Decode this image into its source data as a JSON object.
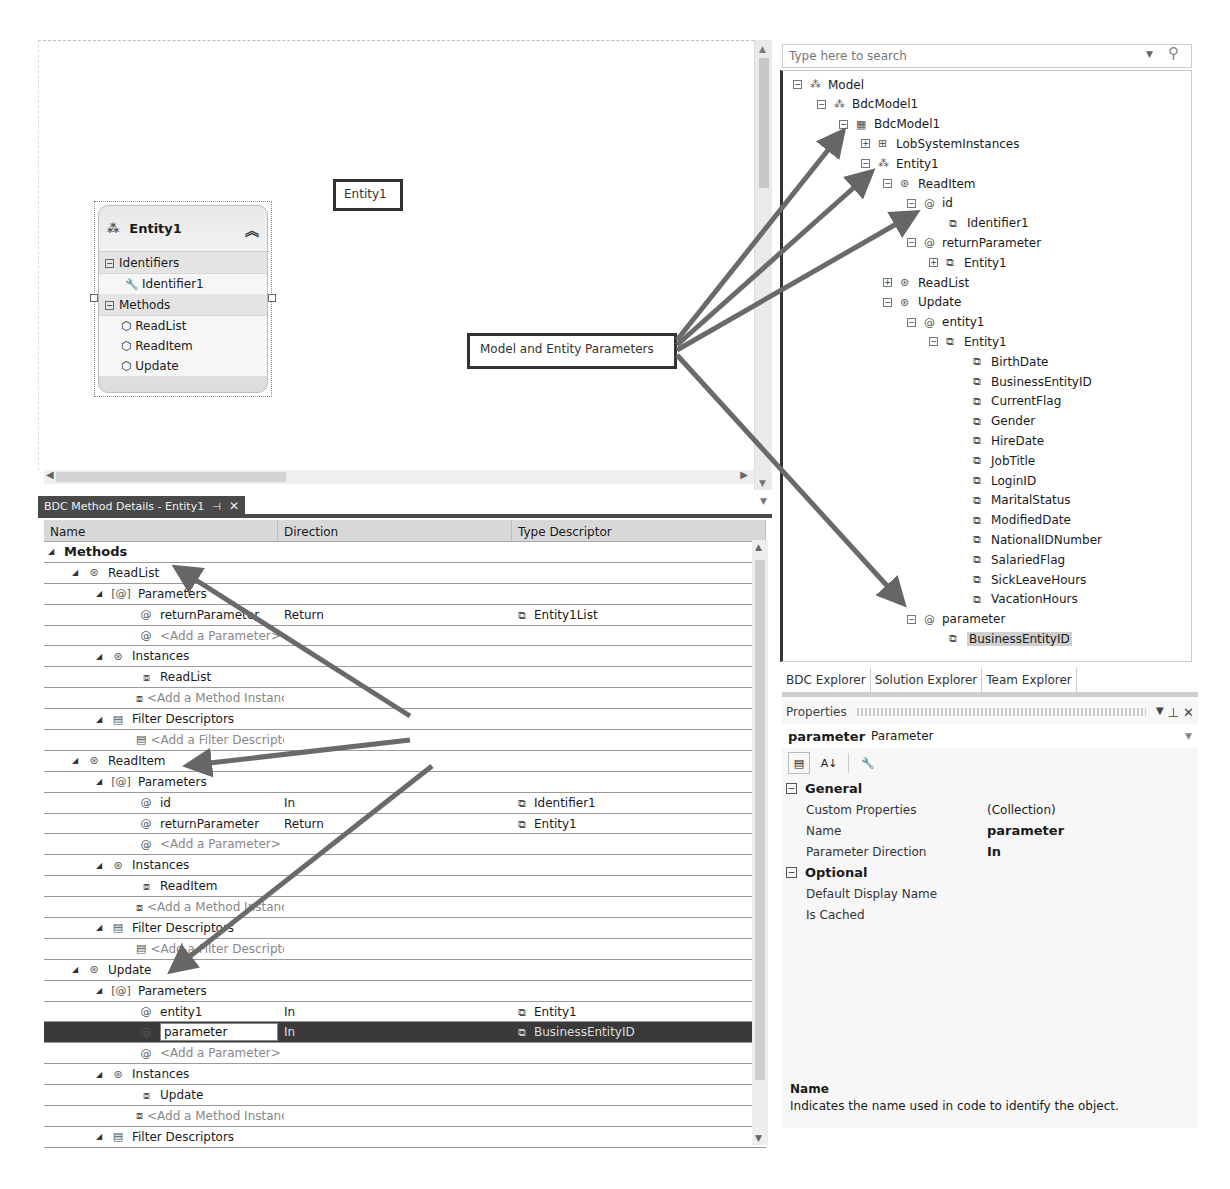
{
  "designer": {
    "entity": {
      "title": "Entity1",
      "sections": [
        {
          "label": "Identifiers",
          "items": [
            "Identifier1"
          ]
        },
        {
          "label": "Methods",
          "items": [
            "ReadList",
            "ReadItem",
            "Update"
          ]
        }
      ]
    },
    "callouts": {
      "entity1": "Entity1",
      "model_params": "Model and Entity Parameters",
      "methods": "ReadList, ReadItems and Update methods"
    }
  },
  "method_details": {
    "tab_title": "BDC Method Details - Entity1",
    "columns": [
      "Name",
      "Direction",
      "Type Descriptor"
    ],
    "rows": [
      {
        "level": 0,
        "kind": "root",
        "name": "Methods",
        "dir": "",
        "type": ""
      },
      {
        "level": 1,
        "kind": "method",
        "name": "ReadList",
        "dir": "",
        "type": ""
      },
      {
        "level": 2,
        "kind": "params",
        "name": "Parameters",
        "dir": "",
        "type": ""
      },
      {
        "level": 3,
        "kind": "param",
        "name": "returnParameter",
        "dir": "Return",
        "type": "Entity1List"
      },
      {
        "level": 3,
        "kind": "param-add",
        "name": "<Add a Parameter>",
        "dir": "",
        "type": ""
      },
      {
        "level": 2,
        "kind": "instances",
        "name": "Instances",
        "dir": "",
        "type": ""
      },
      {
        "level": 3,
        "kind": "instance",
        "name": "ReadList",
        "dir": "",
        "type": ""
      },
      {
        "level": 3,
        "kind": "instance-add",
        "name": "<Add a Method Instance>",
        "dir": "",
        "type": ""
      },
      {
        "level": 2,
        "kind": "filters",
        "name": "Filter Descriptors",
        "dir": "",
        "type": ""
      },
      {
        "level": 3,
        "kind": "filter-add",
        "name": "<Add a Filter Descriptor>",
        "dir": "",
        "type": ""
      },
      {
        "level": 1,
        "kind": "method",
        "name": "ReadItem",
        "dir": "",
        "type": ""
      },
      {
        "level": 2,
        "kind": "params",
        "name": "Parameters",
        "dir": "",
        "type": ""
      },
      {
        "level": 3,
        "kind": "param",
        "name": "id",
        "dir": "In",
        "type": "Identifier1"
      },
      {
        "level": 3,
        "kind": "param",
        "name": "returnParameter",
        "dir": "Return",
        "type": "Entity1"
      },
      {
        "level": 3,
        "kind": "param-add",
        "name": "<Add a Parameter>",
        "dir": "",
        "type": ""
      },
      {
        "level": 2,
        "kind": "instances",
        "name": "Instances",
        "dir": "",
        "type": ""
      },
      {
        "level": 3,
        "kind": "instance",
        "name": "ReadItem",
        "dir": "",
        "type": ""
      },
      {
        "level": 3,
        "kind": "instance-add",
        "name": "<Add a Method Instance>",
        "dir": "",
        "type": ""
      },
      {
        "level": 2,
        "kind": "filters",
        "name": "Filter Descriptors",
        "dir": "",
        "type": ""
      },
      {
        "level": 3,
        "kind": "filter-add",
        "name": "<Add a Filter Descriptor>",
        "dir": "",
        "type": ""
      },
      {
        "level": 1,
        "kind": "method",
        "name": "Update",
        "dir": "",
        "type": ""
      },
      {
        "level": 2,
        "kind": "params",
        "name": "Parameters",
        "dir": "",
        "type": ""
      },
      {
        "level": 3,
        "kind": "param",
        "name": "entity1",
        "dir": "In",
        "type": "Entity1"
      },
      {
        "level": 3,
        "kind": "param",
        "name": "parameter",
        "dir": "In",
        "type": "BusinessEntityID",
        "selected": true,
        "editing": true
      },
      {
        "level": 3,
        "kind": "param-add",
        "name": "<Add a Parameter>",
        "dir": "",
        "type": ""
      },
      {
        "level": 2,
        "kind": "instances",
        "name": "Instances",
        "dir": "",
        "type": ""
      },
      {
        "level": 3,
        "kind": "instance",
        "name": "Update",
        "dir": "",
        "type": ""
      },
      {
        "level": 3,
        "kind": "instance-add",
        "name": "<Add a Method Instance>",
        "dir": "",
        "type": ""
      },
      {
        "level": 2,
        "kind": "filters",
        "name": "Filter Descriptors",
        "dir": "",
        "type": ""
      }
    ]
  },
  "explorer": {
    "search_placeholder": "Type here to search",
    "tree": [
      {
        "x": 10,
        "exp": "-",
        "icon": "entity",
        "label": "Model"
      },
      {
        "x": 34,
        "exp": "-",
        "icon": "entity",
        "label": "BdcModel1"
      },
      {
        "x": 56,
        "exp": "-",
        "icon": "lobsystem",
        "label": "BdcModel1"
      },
      {
        "x": 78,
        "exp": "+",
        "icon": "lobinstances",
        "label": "LobSystemInstances"
      },
      {
        "x": 78,
        "exp": "-",
        "icon": "entity",
        "label": "Entity1"
      },
      {
        "x": 100,
        "exp": "-",
        "icon": "method",
        "label": "ReadItem"
      },
      {
        "x": 124,
        "exp": "-",
        "icon": "param",
        "label": "id"
      },
      {
        "x": 166,
        "exp": "",
        "icon": "type",
        "label": "Identifier1"
      },
      {
        "x": 124,
        "exp": "-",
        "icon": "param",
        "label": "returnParameter"
      },
      {
        "x": 146,
        "exp": "+",
        "icon": "type",
        "label": "Entity1"
      },
      {
        "x": 100,
        "exp": "+",
        "icon": "method",
        "label": "ReadList"
      },
      {
        "x": 100,
        "exp": "-",
        "icon": "method",
        "label": "Update"
      },
      {
        "x": 124,
        "exp": "-",
        "icon": "param",
        "label": "entity1"
      },
      {
        "x": 146,
        "exp": "-",
        "icon": "type",
        "label": "Entity1"
      },
      {
        "x": 190,
        "exp": "",
        "icon": "type",
        "label": "BirthDate"
      },
      {
        "x": 190,
        "exp": "",
        "icon": "type",
        "label": "BusinessEntityID"
      },
      {
        "x": 190,
        "exp": "",
        "icon": "type",
        "label": "CurrentFlag"
      },
      {
        "x": 190,
        "exp": "",
        "icon": "type",
        "label": "Gender"
      },
      {
        "x": 190,
        "exp": "",
        "icon": "type",
        "label": "HireDate"
      },
      {
        "x": 190,
        "exp": "",
        "icon": "type",
        "label": "JobTitle"
      },
      {
        "x": 190,
        "exp": "",
        "icon": "type",
        "label": "LoginID"
      },
      {
        "x": 190,
        "exp": "",
        "icon": "type",
        "label": "MaritalStatus"
      },
      {
        "x": 190,
        "exp": "",
        "icon": "type",
        "label": "ModifiedDate"
      },
      {
        "x": 190,
        "exp": "",
        "icon": "type",
        "label": "NationalIDNumber"
      },
      {
        "x": 190,
        "exp": "",
        "icon": "type",
        "label": "SalariedFlag"
      },
      {
        "x": 190,
        "exp": "",
        "icon": "type",
        "label": "SickLeaveHours"
      },
      {
        "x": 190,
        "exp": "",
        "icon": "type",
        "label": "VacationHours"
      },
      {
        "x": 124,
        "exp": "-",
        "icon": "param",
        "label": "parameter"
      },
      {
        "x": 166,
        "exp": "",
        "icon": "type",
        "label": "BusinessEntityID",
        "highlight": true
      }
    ],
    "tabs": [
      "BDC Explorer",
      "Solution Explorer",
      "Team Explorer"
    ]
  },
  "properties": {
    "title": "Properties",
    "object_name": "parameter",
    "object_type": "Parameter",
    "categories": [
      {
        "label": "General",
        "rows": [
          {
            "name": "Custom Properties",
            "value": "(Collection)",
            "bold": false
          },
          {
            "name": "Name",
            "value": "parameter",
            "bold": true
          },
          {
            "name": "Parameter Direction",
            "value": "In",
            "bold": true
          }
        ]
      },
      {
        "label": "Optional",
        "rows": [
          {
            "name": "Default Display Name",
            "value": "",
            "bold": false
          },
          {
            "name": "Is Cached",
            "value": "",
            "bold": false
          }
        ]
      }
    ],
    "description_title": "Name",
    "description_text": "Indicates the name used in code to identify the object."
  },
  "icons": {
    "entity": "⁂",
    "lobsystem": "▦",
    "lobinstances": "⊞",
    "method": "⊛",
    "param": "@",
    "type": "⧉",
    "identifier": "🔧",
    "filter": "▤",
    "instance": "⧈"
  }
}
